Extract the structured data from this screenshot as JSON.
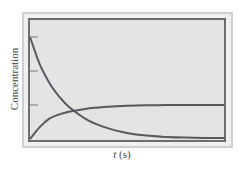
{
  "chart_data": {
    "type": "line",
    "title": "",
    "xlabel": "t (s)",
    "xlabel_var": "t",
    "xlabel_unit": "(s)",
    "ylabel": "Concentration",
    "grid": false,
    "legend": "none",
    "y_ticks": [
      1,
      2,
      3
    ],
    "ylim": [
      0,
      3
    ],
    "xlim": [
      0,
      10
    ],
    "x": [
      0,
      0.5,
      1,
      1.5,
      2,
      3,
      4,
      5,
      6,
      7,
      8,
      9,
      10
    ],
    "series": [
      {
        "name": "reactant (decreasing)",
        "values": [
          3.0,
          2.2,
          1.65,
          1.25,
          0.95,
          0.55,
          0.32,
          0.18,
          0.1,
          0.06,
          0.04,
          0.03,
          0.03
        ]
      },
      {
        "name": "product (increasing)",
        "values": [
          0.0,
          0.35,
          0.6,
          0.72,
          0.8,
          0.9,
          0.95,
          0.98,
          0.99,
          1.0,
          1.0,
          1.0,
          1.0
        ]
      }
    ],
    "colors": {
      "frame": "#c8c8c8",
      "plot_bg": "#e6e6e6",
      "curve": "#555a60",
      "axis": "#6a6a6a"
    }
  }
}
